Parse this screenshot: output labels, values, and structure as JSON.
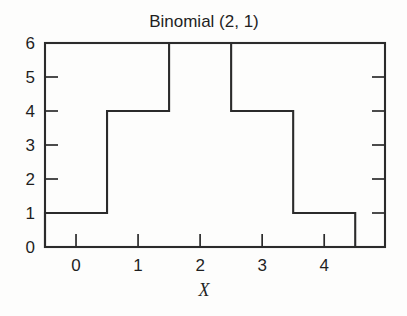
{
  "figure": {
    "background_color": "#fdfdfc",
    "ink_color": "#2b2b2b"
  },
  "chart_data": {
    "type": "bar",
    "title": "Binomial (2, 1)",
    "xlabel": "X",
    "ylabel": "",
    "categories": [
      "0",
      "1",
      "2",
      "3",
      "4"
    ],
    "x": [
      0,
      1,
      2,
      3,
      4
    ],
    "values": [
      1,
      4,
      6,
      4,
      1
    ],
    "xlim": [
      -0.5,
      4.98
    ],
    "ylim": [
      0,
      6
    ],
    "xticks": [
      0,
      1,
      2,
      3,
      4
    ],
    "xtick_labels": [
      "0",
      "1",
      "2",
      "3",
      "4"
    ],
    "yticks": [
      0,
      1,
      2,
      3,
      4,
      5,
      6
    ],
    "ytick_labels": [
      "0",
      "1",
      "2",
      "3",
      "4",
      "5",
      "6"
    ],
    "bar_width": 1,
    "bar_style": "outline",
    "grid": false,
    "legend": null,
    "tick_direction": "in",
    "ticks_on_right_axis": true
  },
  "labels": {
    "y": [
      "6",
      "5",
      "4",
      "3",
      "2",
      "1",
      "0"
    ],
    "x": [
      "0",
      "1",
      "2",
      "3",
      "4"
    ]
  }
}
